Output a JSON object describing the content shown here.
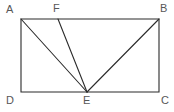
{
  "figure": {
    "kind": "plane-geometry-diagram",
    "canvas": {
      "width": 174,
      "height": 112
    },
    "colors": {
      "background": "#ffffff",
      "stroke": "#2b2b2b",
      "label": "#575757"
    },
    "stroke_width": 1.1,
    "label_font_size": 11,
    "points": [
      {
        "id": "A",
        "label": "A",
        "x": 21,
        "y": 19,
        "label_x": 6,
        "label_y": 4,
        "on": "rectangle-corner-top-left"
      },
      {
        "id": "F",
        "label": "F",
        "x": 58,
        "y": 19,
        "label_x": 53,
        "label_y": 3,
        "on": "top-edge"
      },
      {
        "id": "B",
        "label": "B",
        "x": 159,
        "y": 19,
        "label_x": 160,
        "label_y": 3,
        "on": "rectangle-corner-top-right"
      },
      {
        "id": "D",
        "label": "D",
        "x": 21,
        "y": 92,
        "label_x": 6,
        "label_y": 95,
        "on": "rectangle-corner-bottom-left"
      },
      {
        "id": "E",
        "label": "E",
        "x": 87,
        "y": 92,
        "label_x": 83,
        "label_y": 95,
        "on": "bottom-edge"
      },
      {
        "id": "C",
        "label": "C",
        "x": 159,
        "y": 92,
        "label_x": 161,
        "label_y": 95,
        "on": "rectangle-corner-bottom-right"
      }
    ],
    "rectangle": {
      "name": "ABCD",
      "x": 21,
      "y": 19,
      "width": 138,
      "height": 73,
      "path": "M21,19 L159,19 L159,92 L21,92 Z"
    },
    "segments": [
      {
        "id": "AE",
        "from": "A",
        "to": "E",
        "x1": 21,
        "y1": 19,
        "x2": 87,
        "y2": 92
      },
      {
        "id": "FE",
        "from": "F",
        "to": "E",
        "x1": 58,
        "y1": 19,
        "x2": 87,
        "y2": 92
      },
      {
        "id": "BE",
        "from": "B",
        "to": "E",
        "x1": 159,
        "y1": 19,
        "x2": 87,
        "y2": 92
      }
    ]
  }
}
